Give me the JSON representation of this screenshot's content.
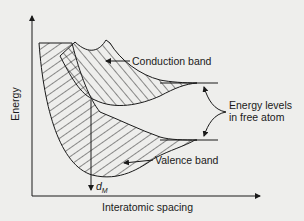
{
  "diagram": {
    "axes": {
      "y_label": "Energy",
      "x_label": "Interatomic spacing"
    },
    "labels": {
      "conduction_band": "Conduction band",
      "valence_band": "Valence band",
      "energy_levels_line1": "Energy levels",
      "energy_levels_line2": "in free atom",
      "equilibrium_spacing": "d",
      "equilibrium_spacing_sub": "M"
    },
    "colors": {
      "ink": "#1a1a1a",
      "paper": "#eeeeec"
    }
  }
}
